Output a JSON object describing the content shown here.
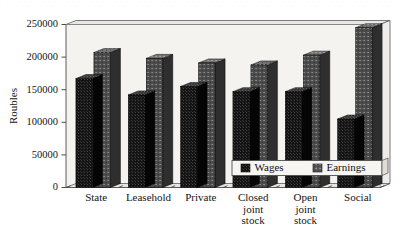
{
  "chart_data": {
    "type": "bar",
    "title": "",
    "subtitle": "",
    "xlabel": "",
    "ylabel": "Roubles",
    "ylim": [
      0,
      250000
    ],
    "ytick_step": 50000,
    "yticks": [
      "0",
      "50000",
      "100000",
      "150000",
      "200000",
      "250000"
    ],
    "grid": false,
    "legend_position": "inside-bottom-right",
    "style": "3d-column",
    "categories": [
      "State",
      "Leasehold",
      "Private",
      "Closed joint stock",
      "Open joint stock",
      "Social"
    ],
    "category_lines": [
      [
        "State"
      ],
      [
        "Leasehold"
      ],
      [
        "Private"
      ],
      [
        "Closed",
        "joint",
        "stock"
      ],
      [
        "Open",
        "joint",
        "stock"
      ],
      [
        "Social"
      ]
    ],
    "series": [
      {
        "name": "Wages",
        "color": "#141414",
        "values": [
          167000,
          142000,
          155000,
          147000,
          147000,
          105000
        ]
      },
      {
        "name": "Earnings",
        "color": "#4a4a4a",
        "values": [
          207000,
          198000,
          191000,
          188000,
          203000,
          245000
        ]
      }
    ]
  },
  "legend": {
    "items": [
      {
        "label": "Wages",
        "swatch": "#141414"
      },
      {
        "label": "Earnings",
        "swatch": "#575757"
      }
    ]
  },
  "axes": {
    "y_title": "Roubles"
  },
  "colors": {
    "background": "#ffffff",
    "plot_back_wall": "#f3f2ef",
    "plot_floor": "#eceae6",
    "frame_line": "#5c5c5c",
    "bar_wages_front": "#141414",
    "bar_wages_top": "#3a3a3a",
    "bar_wages_side": "#0a0a0a",
    "bar_earnings_front": "#4a4a4a",
    "bar_earnings_top": "#6e6e6e",
    "bar_earnings_side": "#2f2f2f",
    "legend_box": "#f5f4f1",
    "text": "#151515"
  }
}
